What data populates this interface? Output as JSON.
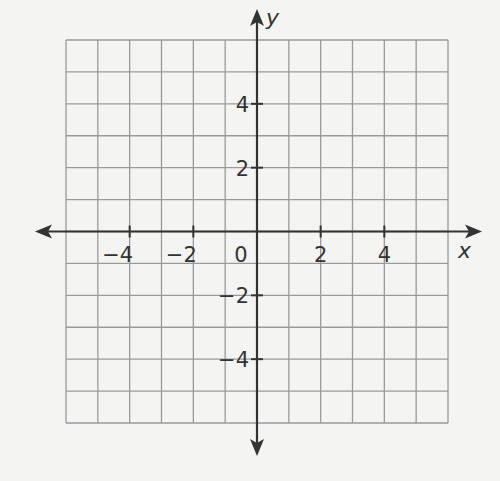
{
  "chart_data": {
    "type": "scatter",
    "title": "",
    "xlabel": "x",
    "ylabel": "y",
    "xlim": [
      -6,
      6
    ],
    "ylim": [
      -6,
      6
    ],
    "grid": true,
    "grid_step": 1,
    "x_ticks": [
      -4,
      -2,
      0,
      2,
      4
    ],
    "y_ticks": [
      -4,
      -2,
      2,
      4
    ],
    "x_tick_labels": [
      "−4",
      "−2",
      "0",
      "2",
      "4"
    ],
    "y_tick_labels": [
      "−4",
      "−2",
      "2",
      "4"
    ],
    "series": [],
    "legend": null
  },
  "colors": {
    "grid": "#9a9a9a",
    "axis": "#333333",
    "background": "#f4f4f2"
  }
}
